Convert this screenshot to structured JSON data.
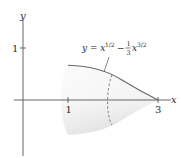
{
  "figure": {
    "type": "solid-of-revolution",
    "axis_labels": {
      "x": "x",
      "y": "y"
    },
    "x_ticks": [
      {
        "value": 1,
        "label": "1"
      },
      {
        "value": 3,
        "label": "3"
      }
    ],
    "y_ticks": [
      {
        "value": 1,
        "label": "1"
      }
    ],
    "curve_label": {
      "lhs": "y = x",
      "exp1": "1/2",
      "minus": "−",
      "frac_num": "1",
      "frac_den": "3",
      "x2": "x",
      "exp2": "3/2"
    },
    "equation": "y = x^(1/2) - (1/3) x^(3/2)",
    "domain": [
      1,
      3
    ],
    "colors": {
      "axis": "#555555",
      "curve": "#6a6a6a",
      "shade_light": "#fbfbfb",
      "shade_dark": "#d6d6d6",
      "text": "#2a2a2a"
    }
  }
}
